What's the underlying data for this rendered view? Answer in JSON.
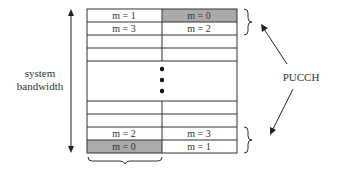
{
  "diagram": {
    "axis_label_line1": "system",
    "axis_label_line2": "bandwidth",
    "pucch_label": "PUCCH",
    "colors": {
      "shaded": "#aaaaaa",
      "line": "#333333",
      "background": "#ffffff"
    },
    "grid": {
      "columns": 2,
      "top_rows": [
        {
          "left": "m = 1",
          "right": "m = 0",
          "shaded": "right"
        },
        {
          "left": "m = 3",
          "right": "m = 2",
          "shaded": "none"
        },
        {
          "left": "",
          "right": "",
          "shaded": "none"
        },
        {
          "left": "",
          "right": "",
          "shaded": "none"
        }
      ],
      "ellipsis": "vertical-dots",
      "bottom_rows": [
        {
          "left": "",
          "right": "",
          "shaded": "none"
        },
        {
          "left": "",
          "right": "",
          "shaded": "none"
        },
        {
          "left": "m = 2",
          "right": "m = 3",
          "shaded": "none"
        },
        {
          "left": "m = 0",
          "right": "m = 1",
          "shaded": "left"
        }
      ]
    },
    "cells": {
      "r0l": "m = 1",
      "r0r": "m = 0",
      "r1l": "m = 3",
      "r1r": "m = 2",
      "r6l": "m = 2",
      "r6r": "m = 3",
      "r7l": "m = 0",
      "r7r": "m = 1"
    }
  }
}
